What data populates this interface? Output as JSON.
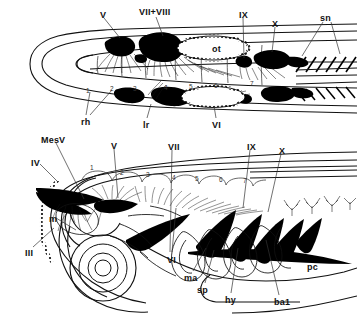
{
  "figure": {
    "panels": [
      {
        "id": "dorsal",
        "view": "dorsal view (top panel)",
        "labels": [
          {
            "name": "label-V-dorsal",
            "text": "V",
            "x": 100,
            "y": 11
          },
          {
            "name": "label-VII-VIII-dorsal",
            "text": "VII+VIII",
            "x": 139,
            "y": 8
          },
          {
            "name": "label-IX-dorsal",
            "text": "IX",
            "x": 239,
            "y": 11
          },
          {
            "name": "label-X-dorsal",
            "text": "X",
            "x": 272,
            "y": 20
          },
          {
            "name": "label-sn-dorsal",
            "text": "sn",
            "x": 320,
            "y": 14
          },
          {
            "name": "label-ot-otic-vesicle",
            "text": "ot",
            "x": 212,
            "y": 45
          },
          {
            "name": "label-rh-rhombomeres",
            "text": "rh",
            "x": 81,
            "y": 118
          },
          {
            "name": "label-lr-dorsal",
            "text": "lr",
            "x": 143,
            "y": 121
          },
          {
            "name": "label-VI-dorsal",
            "text": "VI",
            "x": 212,
            "y": 121
          }
        ],
        "rhombomere_numbers": [
          {
            "text": "1",
            "x": 86,
            "y": 88
          },
          {
            "text": "2",
            "x": 110,
            "y": 86
          },
          {
            "text": "3",
            "x": 133,
            "y": 86
          },
          {
            "text": "4",
            "x": 164,
            "y": 85
          },
          {
            "text": "5",
            "x": 189,
            "y": 84
          },
          {
            "text": "6",
            "x": 214,
            "y": 83
          },
          {
            "text": "7",
            "x": 250,
            "y": 81
          }
        ]
      },
      {
        "id": "lateral",
        "view": "lateral view (bottom panel)",
        "labels": [
          {
            "name": "label-MesV",
            "text": "MesV",
            "x": 41,
            "y": 136
          },
          {
            "name": "label-IV",
            "text": "IV",
            "x": 31,
            "y": 159
          },
          {
            "name": "label-V-lateral",
            "text": "V",
            "x": 111,
            "y": 142
          },
          {
            "name": "label-VII-lateral",
            "text": "VII",
            "x": 168,
            "y": 143
          },
          {
            "name": "label-IX-lateral",
            "text": "IX",
            "x": 247,
            "y": 143
          },
          {
            "name": "label-X-lateral",
            "text": "X",
            "x": 279,
            "y": 147
          },
          {
            "name": "label-III",
            "text": "III",
            "x": 25,
            "y": 249
          },
          {
            "name": "label-m-mauthner",
            "text": "m",
            "x": 49,
            "y": 215
          },
          {
            "name": "label-VI-lateral",
            "text": "VI",
            "x": 167,
            "y": 256
          },
          {
            "name": "label-ma",
            "text": "ma",
            "x": 184,
            "y": 274
          },
          {
            "name": "label-sp",
            "text": "sp",
            "x": 197,
            "y": 286
          },
          {
            "name": "label-hy",
            "text": "hy",
            "x": 225,
            "y": 296
          },
          {
            "name": "label-ba1",
            "text": "ba1",
            "x": 274,
            "y": 298
          },
          {
            "name": "label-pc",
            "text": "pc",
            "x": 307,
            "y": 263
          }
        ],
        "rhombomere_numbers": [
          {
            "text": "1",
            "x": 90,
            "y": 165
          },
          {
            "text": "2",
            "x": 120,
            "y": 170
          },
          {
            "text": "3",
            "x": 146,
            "y": 172
          },
          {
            "text": "4",
            "x": 172,
            "y": 175
          },
          {
            "text": "5",
            "x": 195,
            "y": 176
          },
          {
            "text": "6",
            "x": 219,
            "y": 177
          },
          {
            "text": "7",
            "x": 243,
            "y": 178
          }
        ]
      }
    ],
    "colors": {
      "ink": "#000000",
      "background": "#ffffff",
      "ganglia_fill": "#000000",
      "outline": "#1a1a1a"
    }
  }
}
